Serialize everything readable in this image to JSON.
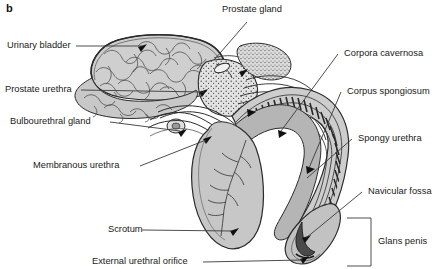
{
  "figure": {
    "panel_letter": "b",
    "width": 447,
    "height": 269,
    "background_color": "#ffffff",
    "text_color": "#1a1a1a",
    "type": "anatomical-illustration"
  },
  "labels": {
    "urinary_bladder": "Urinary bladder",
    "prostate_urethra": "Prostate urethra",
    "bulbourethral_gland": "Bulbourethral gland",
    "membranous_urethra": "Membranous urethra",
    "scrotum": "Scrotum",
    "external_urethral_orifice": "External urethral orifice",
    "prostate_gland": "Prostate gland",
    "corpora_cavernosa": "Corpora cavernosa",
    "corpus_spongiosum": "Corpus spongiosum",
    "spongy_urethra": "Spongy urethra",
    "navicular_fossa": "Navicular fossa",
    "glans_penis": "Glans penis"
  },
  "palette": {
    "line": "#2b2b2b",
    "leader": "#3a3a3a",
    "tissue_light": "#d8d8d8",
    "tissue_mid": "#b9b9b9",
    "tissue_dark": "#8d8d8d",
    "tissue_darkest": "#5a5a5a",
    "white": "#ffffff"
  }
}
